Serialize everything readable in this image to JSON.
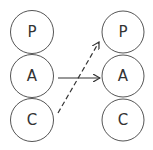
{
  "diagram": {
    "left_column": {
      "nodes": [
        {
          "id": "left-p",
          "label": "P",
          "cx": 32,
          "cy": 32,
          "r": 21.5
        },
        {
          "id": "left-a",
          "label": "A",
          "cx": 32,
          "cy": 76,
          "r": 21.5
        },
        {
          "id": "left-c",
          "label": "C",
          "cx": 32,
          "cy": 120,
          "r": 21.5
        }
      ]
    },
    "right_column": {
      "nodes": [
        {
          "id": "right-p",
          "label": "P",
          "cx": 123,
          "cy": 32,
          "r": 21
        },
        {
          "id": "right-a",
          "label": "A",
          "cx": 123,
          "cy": 76,
          "r": 21
        },
        {
          "id": "right-c",
          "label": "C",
          "cx": 123,
          "cy": 120,
          "r": 21
        }
      ]
    },
    "edges": [
      {
        "from": "left-a",
        "to": "right-a",
        "style": "solid",
        "x1": 58,
        "y1": 78,
        "x2": 100,
        "y2": 78
      },
      {
        "from": "left-c",
        "to": "right-p",
        "style": "dashed",
        "x1": 58,
        "y1": 113,
        "x2": 99,
        "y2": 42
      }
    ],
    "colors": {
      "stroke": "#555555",
      "text": "#333333",
      "arrow": "#333333",
      "background": "#ffffff"
    }
  }
}
